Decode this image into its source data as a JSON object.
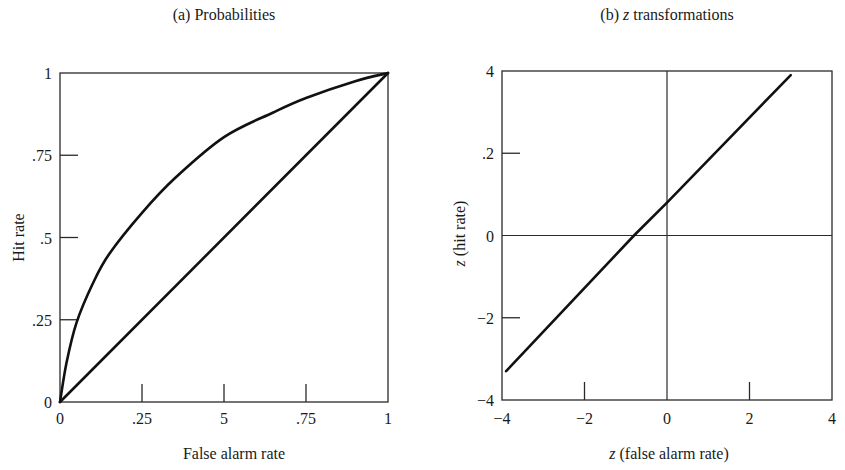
{
  "panel_a": {
    "title": "(a) Probabilities",
    "xlabel": "False alarm rate",
    "ylabel": "Hit rate",
    "xticks": [
      "0",
      ".25",
      "5",
      ".75",
      "1"
    ],
    "yticks": [
      "0",
      ".25",
      ".5",
      ".75",
      "1"
    ]
  },
  "panel_b": {
    "title_prefix": "(b) ",
    "title_italic": "z",
    "title_suffix": " transformations",
    "xlabel_italic": "z",
    "xlabel_rest": " (false alarm rate)",
    "ylabel_italic": "z",
    "ylabel_rest": " (hit rate)",
    "xticks": [
      "−4",
      "−2",
      "0",
      "2",
      "4"
    ],
    "yticks": [
      "−4",
      "−2",
      "0",
      ".2",
      "4"
    ]
  },
  "chart_data": [
    {
      "type": "line",
      "title": "(a) Probabilities",
      "xlabel": "False alarm rate",
      "ylabel": "Hit rate",
      "xlim": [
        0,
        1
      ],
      "ylim": [
        0,
        1
      ],
      "xtick_labels": [
        "0",
        ".25",
        "5",
        ".75",
        "1"
      ],
      "ytick_labels": [
        "0",
        ".25",
        ".5",
        ".75",
        "1"
      ],
      "grid": false,
      "series": [
        {
          "name": "ROC curve (d' > 0)",
          "x": [
            0,
            0.02,
            0.05,
            0.1,
            0.15,
            0.25,
            0.35,
            0.5,
            0.65,
            0.75,
            0.9,
            1
          ],
          "y": [
            0,
            0.12,
            0.24,
            0.36,
            0.45,
            0.575,
            0.68,
            0.805,
            0.88,
            0.924,
            0.975,
            1
          ]
        },
        {
          "name": "Chance diagonal",
          "x": [
            0,
            1
          ],
          "y": [
            0,
            1
          ]
        }
      ]
    },
    {
      "type": "line",
      "title": "(b) z transformations",
      "xlabel": "z (false alarm rate)",
      "ylabel": "z (hit rate)",
      "xlim": [
        -4,
        4
      ],
      "ylim": [
        -4,
        4
      ],
      "xtick_labels": [
        "-4",
        "-2",
        "0",
        "2",
        "4"
      ],
      "ytick_labels": [
        "-4",
        "-2",
        "0",
        ".2",
        "4"
      ],
      "grid": false,
      "reference_lines": {
        "x0": true,
        "y0": true
      },
      "series": [
        {
          "name": "z-transformed ROC",
          "x": [
            -3.9,
            -0.8,
            0,
            3.0
          ],
          "y": [
            -3.3,
            0,
            0.8,
            3.9
          ]
        }
      ]
    }
  ]
}
